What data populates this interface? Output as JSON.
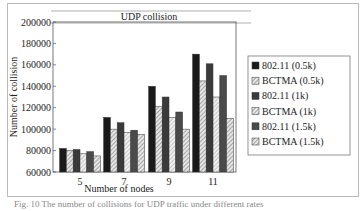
{
  "chart_data": {
    "type": "bar",
    "title": "UDP collision",
    "xlabel": "Number of nodes",
    "ylabel": "Number of collision",
    "categories": [
      "5",
      "7",
      "9",
      "11"
    ],
    "ylim": [
      60000,
      200000
    ],
    "yticks": [
      60000,
      80000,
      100000,
      120000,
      140000,
      160000,
      180000,
      200000
    ],
    "grid": false,
    "legend_position": "right",
    "series": [
      {
        "name": "802.11 (0.5k)",
        "values": [
          82000,
          111000,
          140000,
          170000
        ],
        "fill": "#1a1a1a",
        "pattern": "solid"
      },
      {
        "name": "BCTMA (0.5k)",
        "values": [
          80000,
          100000,
          121000,
          145000
        ],
        "fill": "#bdbdbd",
        "pattern": "hatch"
      },
      {
        "name": "802.11 (1k)",
        "values": [
          81000,
          106000,
          130000,
          161000
        ],
        "fill": "#3a3a3a",
        "pattern": "solid"
      },
      {
        "name": "BCTMA (1k)",
        "values": [
          77000,
          97000,
          111000,
          130000
        ],
        "fill": "#d4d4d4",
        "pattern": "hatch"
      },
      {
        "name": "802.11 (1.5k)",
        "values": [
          79000,
          99000,
          116000,
          150000
        ],
        "fill": "#4a4a4a",
        "pattern": "solid"
      },
      {
        "name": "BCTMA (1.5k)",
        "values": [
          75000,
          95000,
          100000,
          110000
        ],
        "fill": "#c8c8c8",
        "pattern": "hatch"
      }
    ]
  },
  "caption": "Fig. 10  The number of collisions for UDP traffic under different rates"
}
